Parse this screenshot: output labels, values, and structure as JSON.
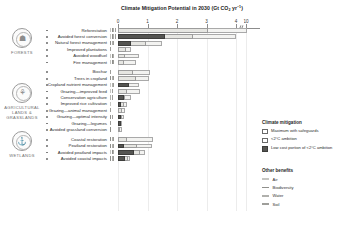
{
  "chart_data": {
    "type": "bar",
    "title_main": "Climate Mitigation Potential in 2030 (Gt CO",
    "title_sub": "2",
    "title_tail": " yr",
    "title_sup": "−1",
    "title_end": ")",
    "xlabel": "",
    "ylabel": "",
    "xlim": [
      0,
      10.5
    ],
    "grid": true,
    "axis_break": {
      "present": true,
      "between": [
        4,
        10
      ]
    },
    "tick_labels": [
      "0",
      "1",
      "2",
      "3",
      "4",
      "10"
    ],
    "tick_values": [
      0,
      1,
      2,
      3,
      4,
      10
    ],
    "legend_position": "right",
    "series": [
      {
        "name": "Maximum with safeguards",
        "color": "#f3f3f1"
      },
      {
        "name": "<2°C ambition",
        "color": "#e6e6e2"
      },
      {
        "name": "Low cost portion of <2°C ambition",
        "color": "#555552"
      }
    ],
    "categories": [
      "Reforestation",
      "Avoided forest conversion",
      "Natural forest management",
      "Improved plantations",
      "Avoided woodfuel",
      "Fire management",
      "Biochar",
      "Trees in cropland",
      "Cropland nutrient management",
      "Grazing—improved feed",
      "Conservation agriculture",
      "Improved rice cultivation",
      "Grazing—animal management",
      "Grazing—optimal intensity",
      "Grazing—legumes",
      "Avoided grassland conversion",
      "Coastal restoration",
      "Peatland restoration",
      "Avoided peatland impacts",
      "Avoided coastal impacts"
    ],
    "rows": [
      {
        "label": "Reforestation",
        "group": "forests",
        "maximum": 10.1,
        "ambition": 3.05,
        "lowcost": 0.0,
        "benefits": [
          "air",
          "biodiversity",
          "water",
          "soil"
        ]
      },
      {
        "label": "Avoided forest conversion",
        "group": "forests",
        "maximum": 4.0,
        "ambition": 2.55,
        "lowcost": 1.6,
        "benefits": [
          "air",
          "biodiversity",
          "water",
          "soil"
        ]
      },
      {
        "label": "Natural forest management",
        "group": "forests",
        "maximum": 1.5,
        "ambition": 0.95,
        "lowcost": 0.45,
        "benefits": [
          "biodiversity",
          "water",
          "soil"
        ]
      },
      {
        "label": "Improved plantations",
        "group": "forests",
        "maximum": 0.45,
        "ambition": 0.28,
        "lowcost": 0.0,
        "benefits": [
          "soil"
        ]
      },
      {
        "label": "Avoided woodfuel",
        "group": "forests",
        "maximum": 0.7,
        "ambition": 0.25,
        "lowcost": 0.0,
        "benefits": [
          "air",
          "biodiversity",
          "water"
        ]
      },
      {
        "label": "Fire management",
        "group": "forests",
        "maximum": 0.6,
        "ambition": 0.2,
        "lowcost": 0.0,
        "benefits": [
          "air",
          "biodiversity",
          "soil"
        ]
      },
      {
        "label": "Biochar",
        "group": "agriculture",
        "maximum": 1.1,
        "ambition": 0.5,
        "lowcost": 0.0,
        "benefits": [
          "soil"
        ]
      },
      {
        "label": "Trees in cropland",
        "group": "agriculture",
        "maximum": 1.05,
        "ambition": 0.6,
        "lowcost": 0.0,
        "benefits": [
          "biodiversity",
          "water",
          "soil"
        ]
      },
      {
        "label": "Cropland nutrient management",
        "group": "agriculture",
        "maximum": 0.7,
        "ambition": 0.38,
        "lowcost": 0.38,
        "benefits": [
          "air",
          "water",
          "soil"
        ]
      },
      {
        "label": "Grazing—improved feed",
        "group": "agriculture",
        "maximum": 0.75,
        "ambition": 0.3,
        "lowcost": 0.0,
        "benefits": [
          "air",
          "soil"
        ]
      },
      {
        "label": "Conservation agriculture",
        "group": "agriculture",
        "maximum": 0.45,
        "ambition": 0.25,
        "lowcost": 0.2,
        "benefits": [
          "water",
          "soil"
        ]
      },
      {
        "label": "Improved rice cultivation",
        "group": "agriculture",
        "maximum": 0.3,
        "ambition": 0.2,
        "lowcost": 0.1,
        "benefits": [
          "air"
        ]
      },
      {
        "label": "Grazing—animal management",
        "group": "agriculture",
        "maximum": 0.25,
        "ambition": 0.12,
        "lowcost": 0.0,
        "benefits": [
          "soil"
        ]
      },
      {
        "label": "Grazing—optimal intensity",
        "group": "agriculture",
        "maximum": 0.2,
        "ambition": 0.12,
        "lowcost": 0.1,
        "benefits": [
          "biodiversity",
          "soil"
        ]
      },
      {
        "label": "Grazing—legumes",
        "group": "agriculture",
        "maximum": 0.15,
        "ambition": 0.1,
        "lowcost": 0.1,
        "benefits": [
          "soil"
        ]
      },
      {
        "label": "Avoided grassland conversion",
        "group": "agriculture",
        "maximum": 0.15,
        "ambition": 0.08,
        "lowcost": 0.0,
        "benefits": [
          "biodiversity"
        ]
      },
      {
        "label": "Coastal restoration",
        "group": "wetlands",
        "maximum": 1.2,
        "ambition": 0.3,
        "lowcost": 0.0,
        "benefits": [
          "biodiversity",
          "water",
          "soil"
        ]
      },
      {
        "label": "Peatland restoration",
        "group": "wetlands",
        "maximum": 1.15,
        "ambition": 0.65,
        "lowcost": 0.22,
        "benefits": [
          "biodiversity",
          "water",
          "soil"
        ]
      },
      {
        "label": "Avoided peatland impacts",
        "group": "wetlands",
        "maximum": 0.9,
        "ambition": 0.75,
        "lowcost": 0.55,
        "benefits": [
          "air",
          "biodiversity",
          "water"
        ]
      },
      {
        "label": "Avoided coastal impacts",
        "group": "wetlands",
        "maximum": 0.4,
        "ambition": 0.35,
        "lowcost": 0.25,
        "benefits": [
          "biodiversity",
          "water",
          "soil"
        ]
      }
    ]
  },
  "categories_sidebar": [
    {
      "key": "forests",
      "label": "FORESTS",
      "glyph": "☗"
    },
    {
      "key": "agriculture",
      "label": "AGRICULTURAL LANDS & GRASSLANDS",
      "glyph": "⚘"
    },
    {
      "key": "wetlands",
      "label": "WETLANDS",
      "glyph": "⚓"
    }
  ],
  "legend": {
    "mitigation_title": "Climate mitigation",
    "items": [
      {
        "label": "Maximum with safeguards",
        "swatch": "sw-max"
      },
      {
        "label": "<2°C ambition",
        "swatch": "sw-amb"
      },
      {
        "label": "Low cost portion of <2°C ambition",
        "swatch": "sw-low"
      }
    ],
    "benefits_title": "Other benefits",
    "benefits": [
      {
        "label": "Air",
        "color": "#c6c6c2"
      },
      {
        "label": "Biodiversity",
        "color": "#8f8f8b"
      },
      {
        "label": "Water",
        "color": "#b0b0ac"
      },
      {
        "label": "Soil",
        "color": "#9e9e9a"
      }
    ]
  }
}
